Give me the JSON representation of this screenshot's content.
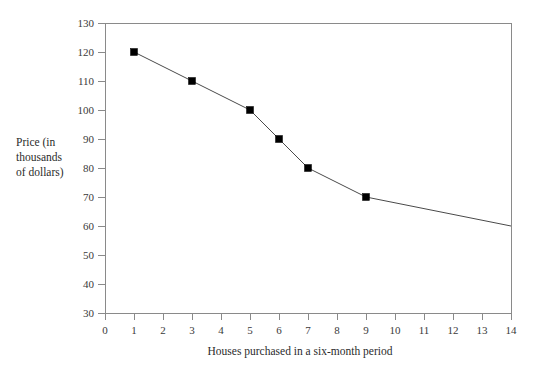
{
  "chart_data": {
    "type": "line",
    "title": "",
    "subtitle": "",
    "xlabel": "Houses purchased in a six-month period",
    "ylabel": "Price (in thousands of dollars)",
    "ylabel_lines": [
      "Price (in",
      "thousands",
      "of dollars)"
    ],
    "xlim": [
      0,
      14
    ],
    "ylim": [
      30,
      130
    ],
    "xticks": [
      0,
      1,
      2,
      3,
      4,
      5,
      6,
      7,
      8,
      9,
      10,
      11,
      12,
      13,
      14
    ],
    "xtick_labels": [
      "0",
      "1",
      "2",
      "3",
      "4",
      "5",
      "6",
      "7",
      "8",
      "9",
      "10",
      "11",
      "12",
      "13",
      "14"
    ],
    "yticks": [
      30,
      40,
      50,
      60,
      70,
      80,
      90,
      100,
      110,
      120,
      130
    ],
    "ytick_labels": [
      "30",
      "40",
      "50",
      "60",
      "70",
      "80",
      "90",
      "100",
      "110",
      "120",
      "130"
    ],
    "grid": false,
    "legend": false,
    "legend_position": "none",
    "marker": "square",
    "marker_color": "#000000",
    "line_color": "#4a4a4a",
    "frame_color": "#8a8a8a",
    "x": [
      1,
      3,
      5,
      6,
      7,
      9,
      14
    ],
    "y": [
      120,
      110,
      100,
      90,
      80,
      70,
      60
    ],
    "series": [
      {
        "name": "Price",
        "points": [
          {
            "x": 1,
            "y": 120,
            "marker": true
          },
          {
            "x": 3,
            "y": 110,
            "marker": true
          },
          {
            "x": 5,
            "y": 100,
            "marker": true
          },
          {
            "x": 6,
            "y": 90,
            "marker": true
          },
          {
            "x": 7,
            "y": 80,
            "marker": true
          },
          {
            "x": 9,
            "y": 70,
            "marker": true
          },
          {
            "x": 14,
            "y": 60,
            "marker": false
          }
        ]
      }
    ]
  }
}
